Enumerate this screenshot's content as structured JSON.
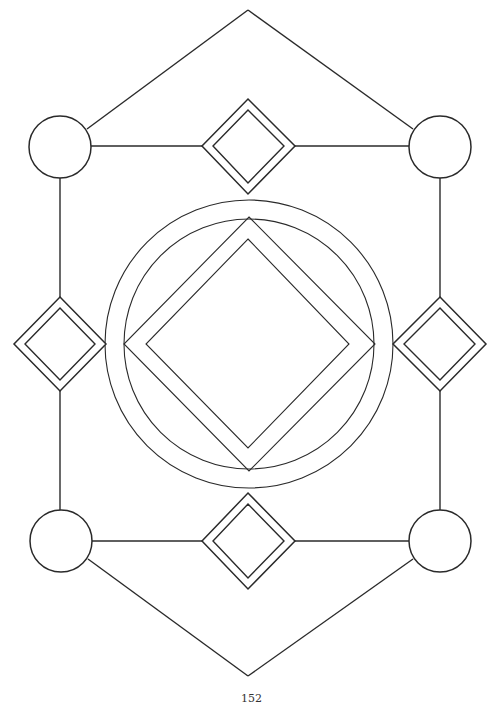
{
  "page": {
    "page_number": "152",
    "background": "#ffffff",
    "line_color": "#2a2a2a"
  },
  "figure": {
    "hexagon_frame": {
      "top_apex": [
        248,
        10
      ],
      "bottom_apex": [
        248,
        676
      ]
    },
    "corner_circles": [
      {
        "cx": 60,
        "cy": 147,
        "r": 31
      },
      {
        "cx": 440,
        "cy": 147,
        "r": 31
      },
      {
        "cx": 61,
        "cy": 541,
        "r": 31
      },
      {
        "cx": 440,
        "cy": 541,
        "r": 31
      }
    ],
    "edge_diamonds": [
      {
        "cx": 248,
        "cy": 146,
        "half": 47
      },
      {
        "cx": 60,
        "cy": 344,
        "half": 47
      },
      {
        "cx": 440,
        "cy": 344,
        "half": 47
      },
      {
        "cx": 248,
        "cy": 541,
        "half": 47
      }
    ],
    "center": {
      "cx": 249,
      "cy": 344,
      "outer_circle_r": 144,
      "inner_circle_r": 125,
      "big_diamond_half": 126,
      "inner_diamond_half": 103
    }
  }
}
